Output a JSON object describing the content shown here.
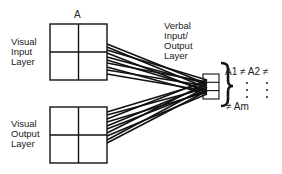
{
  "diagram": {
    "grid_top_label": "A",
    "visual_input": {
      "line1": "Visual",
      "line2": "Input",
      "line3": "Layer"
    },
    "visual_output": {
      "line1": "Visual",
      "line2": "Output",
      "line3": "Layer"
    },
    "verbal": {
      "line1": "Verbal",
      "line2": "Input/",
      "line3": "Output",
      "line4": "Layer"
    },
    "equation_top": "A1 ≠ A2 ≠",
    "equation_bottom": "≠ Am",
    "colors": {
      "line": "#111111",
      "background": "#ffffff"
    }
  }
}
